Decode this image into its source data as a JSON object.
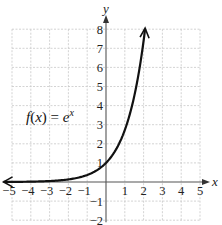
{
  "chart_data": {
    "type": "line",
    "title": "",
    "xlabel": "x",
    "ylabel": "y",
    "xlim": [
      -5,
      5
    ],
    "ylim": [
      -2,
      8
    ],
    "grid": true,
    "x_ticks": [
      "−5",
      "−4",
      "−3",
      "−2",
      "−1",
      "1",
      "2",
      "3",
      "4",
      "5"
    ],
    "y_ticks": [
      "8",
      "7",
      "6",
      "5",
      "4",
      "3",
      "2",
      "1",
      "−1",
      "−2"
    ],
    "annotation": "f(x) = e^x",
    "series": [
      {
        "name": "f(x) = e^x",
        "x": [
          -5,
          -4,
          -3,
          -2,
          -1,
          0,
          0.5,
          1,
          1.5,
          2.08
        ],
        "y": [
          0.007,
          0.018,
          0.05,
          0.135,
          0.368,
          1,
          1.649,
          2.718,
          4.482,
          8.0
        ]
      }
    ]
  },
  "labels": {
    "x_axis": "x",
    "y_axis": "y",
    "function_prefix": "f(x) = e",
    "function_exponent": "x"
  }
}
